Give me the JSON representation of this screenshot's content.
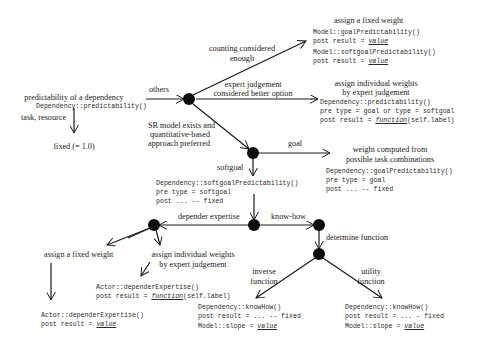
{
  "nodes": {
    "root": {
      "title": "predictability of a dependency",
      "code": "Dependency::predictability()"
    },
    "task_resource_label": "task, resource",
    "fixed_label": "fixed (= 1.0)",
    "others_label": "others",
    "counting_label_1": "counting considered",
    "counting_label_2": "enough",
    "expert_label_1": "expert judgement",
    "expert_label_2": "considered better option",
    "sr_label_1": "SR model exists and",
    "sr_label_2": "quantitative-based",
    "sr_label_3": "approach preferred",
    "fixed_weight_top": {
      "title": "assign a fixed weight",
      "line1": "Model::goalPredictability()",
      "line2_pre": "post result = ",
      "line2_val": "value",
      "line3": "Model::softgoalPredictability()",
      "line4_pre": "post result = ",
      "line4_val": "value"
    },
    "individual_top": {
      "title_1": "assign individual weights",
      "title_2": "by expert judgement",
      "line1": "Dependency::predictability()",
      "line2": "pre type = goal or type = softgoal",
      "line3_pre": "post result = ",
      "line3_fn": "function",
      "line3_post": "(self.label)"
    },
    "goal_label": "goal",
    "goal_weight": {
      "title_1": "weight computed from",
      "title_2": "possible task combinations",
      "line1": "Dependency::goalPredictability()",
      "line2": "pre type = goal",
      "line3": "post ... -- fixed"
    },
    "softgoal_label": "softgoal",
    "softgoal_box": {
      "line1": "Dependency::softgoalPredictability()",
      "line2": "pre type = softgoal",
      "line3": "post ... -- fixed"
    },
    "depender_label": "depender expertise",
    "knowhow_label": "know-how",
    "determine_label": "determine function",
    "fixed_weight_bottom": {
      "title": "assign a fixed weight",
      "line1": "Actor::dependerExpertise()",
      "line2_pre": "post result = ",
      "line2_val": "value"
    },
    "individual_bottom": {
      "title_1": "assign individual weights",
      "title_2": "by expert judgement",
      "line1": "Actor::dependerExpertise()",
      "line2_pre": "post result = ",
      "line2_fn": "function",
      "line2_post": "(self.label)"
    },
    "inverse_label_1": "inverse",
    "inverse_label_2": "function",
    "utility_label_1": "utility",
    "utility_label_2": "function",
    "inverse_box": {
      "line1": "Dependency::knowHow()",
      "line2": "post result = ... -- fixed",
      "line3_pre": "Model::slope = ",
      "line3_val": "value"
    },
    "utility_box": {
      "line1": "Dependency::knowHow()",
      "line2": "post result = ... - fixed",
      "line3_pre": "Model::slope = ",
      "line3_val": "value"
    }
  },
  "colors": {
    "line": "#1a1a1a",
    "node": "#0d0d0d",
    "background": "#ffffff"
  }
}
